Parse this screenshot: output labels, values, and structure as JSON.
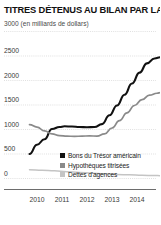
{
  "chart_data": {
    "type": "line",
    "title": "TITRES DÉTENUS AU BILAN PAR LA FED",
    "subtitle": "(en milliards de dollars)",
    "top_axis_value": "3000",
    "xlabel": "",
    "ylabel": "",
    "ylim": [
      0,
      3000
    ],
    "xlim": [
      2009.6,
      2015.0
    ],
    "grid": true,
    "legend_position": "inside-bottom-right",
    "yticks": [
      "3000",
      "2500",
      "2000",
      "1500",
      "1000",
      "500",
      "0"
    ],
    "ytick_values": [
      3000,
      2500,
      2000,
      1500,
      1000,
      500,
      0
    ],
    "categories": [
      "2010",
      "2011",
      "2012",
      "2013",
      "2014"
    ],
    "xtick_values": [
      2010,
      2011,
      2012,
      2013,
      2014
    ],
    "series": [
      {
        "name": "Bons du Trésor américain",
        "color": "#111111",
        "x": [
          2009.7,
          2010.0,
          2010.3,
          2010.6,
          2010.9,
          2011.1,
          2011.4,
          2011.7,
          2012.0,
          2012.3,
          2012.6,
          2012.9,
          2013.2,
          2013.5,
          2013.8,
          2014.1,
          2014.4,
          2014.7,
          2014.95
        ],
        "values": [
          490,
          680,
          790,
          1000,
          1040,
          1055,
          1050,
          1040,
          1035,
          1040,
          1100,
          1280,
          1480,
          1700,
          1930,
          2150,
          2340,
          2440,
          2465
        ]
      },
      {
        "name": "Hypothèques titrisées",
        "color": "#8a8a8a",
        "x": [
          2009.7,
          2010.0,
          2010.3,
          2010.6,
          2010.9,
          2011.2,
          2011.5,
          2011.8,
          2012.1,
          2012.4,
          2012.7,
          2013.0,
          2013.3,
          2013.6,
          2013.9,
          2014.2,
          2014.5,
          2014.8,
          2014.95
        ],
        "values": [
          1090,
          1040,
          960,
          900,
          865,
          855,
          850,
          855,
          860,
          855,
          900,
          1020,
          1170,
          1330,
          1480,
          1600,
          1690,
          1730,
          1745
        ]
      },
      {
        "name": "Dettes d'agences",
        "color": "#c4c4c4",
        "x": [
          2009.7,
          2010.2,
          2010.7,
          2011.2,
          2011.7,
          2012.2,
          2012.7,
          2013.2,
          2013.7,
          2014.2,
          2014.7,
          2014.95
        ],
        "values": [
          170,
          160,
          148,
          130,
          112,
          98,
          85,
          72,
          64,
          56,
          50,
          48
        ]
      }
    ]
  }
}
